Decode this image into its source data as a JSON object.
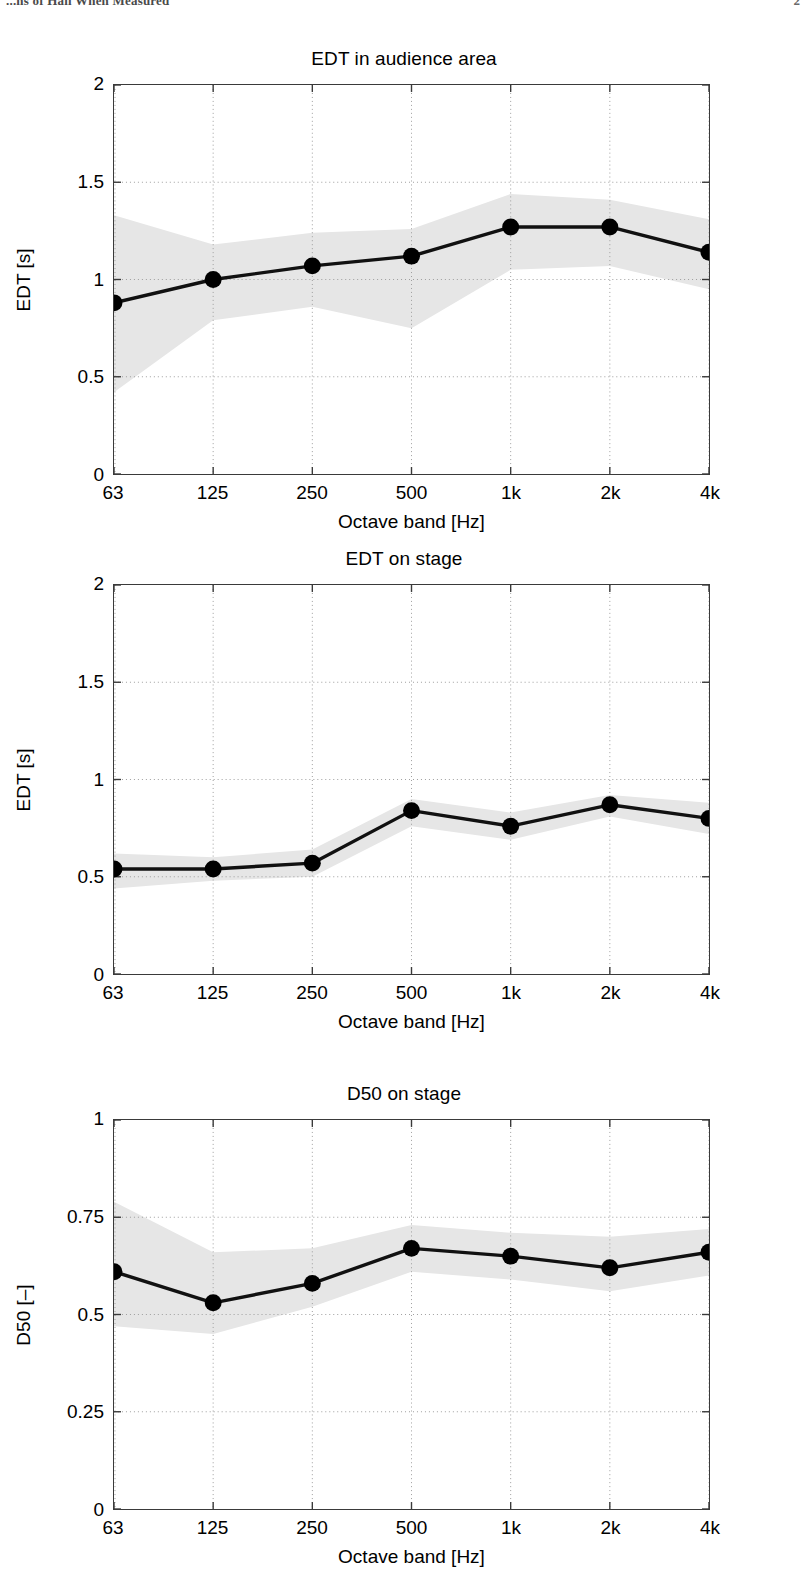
{
  "page": {
    "header_left": "...ns of Hall When Measured",
    "header_right": "2"
  },
  "figures": [
    {
      "id": "edt-audience-area",
      "chart_data": {
        "type": "line",
        "title": "EDT in audience area",
        "xlabel": "Octave band [Hz]",
        "ylabel": "EDT [s]",
        "categories": [
          "63",
          "125",
          "250",
          "500",
          "1k",
          "2k",
          "4k"
        ],
        "values": [
          0.88,
          1.0,
          1.07,
          1.12,
          1.27,
          1.27,
          1.14
        ],
        "band_upper": [
          1.33,
          1.18,
          1.24,
          1.26,
          1.44,
          1.41,
          1.31
        ],
        "band_lower": [
          0.42,
          0.79,
          0.86,
          0.75,
          1.05,
          1.07,
          0.95
        ],
        "ylim": [
          0,
          2
        ],
        "yticks": [
          0,
          0.5,
          1,
          1.5,
          2
        ],
        "ytick_labels": [
          "0",
          "0.5",
          "1",
          "1.5",
          "2"
        ],
        "grid": true,
        "legend": "none",
        "series": [
          {
            "name": "mean",
            "values": [
              0.88,
              1.0,
              1.07,
              1.12,
              1.27,
              1.27,
              1.14
            ]
          },
          {
            "name": "spread-upper",
            "values": [
              1.33,
              1.18,
              1.24,
              1.26,
              1.44,
              1.41,
              1.31
            ]
          },
          {
            "name": "spread-lower",
            "values": [
              0.42,
              0.79,
              0.86,
              0.75,
              1.05,
              1.07,
              0.95
            ]
          }
        ]
      }
    },
    {
      "id": "edt-on-stage",
      "chart_data": {
        "type": "line",
        "title": "EDT on stage",
        "xlabel": "Octave band [Hz]",
        "ylabel": "EDT [s]",
        "categories": [
          "63",
          "125",
          "250",
          "500",
          "1k",
          "2k",
          "4k"
        ],
        "values": [
          0.54,
          0.54,
          0.57,
          0.84,
          0.76,
          0.87,
          0.8
        ],
        "band_upper": [
          0.62,
          0.6,
          0.64,
          0.9,
          0.83,
          0.92,
          0.88
        ],
        "band_lower": [
          0.44,
          0.48,
          0.5,
          0.76,
          0.69,
          0.81,
          0.72
        ],
        "ylim": [
          0,
          2
        ],
        "yticks": [
          0,
          0.5,
          1,
          1.5,
          2
        ],
        "ytick_labels": [
          "0",
          "0.5",
          "1",
          "1.5",
          "2"
        ],
        "grid": true,
        "legend": "none",
        "series": [
          {
            "name": "mean",
            "values": [
              0.54,
              0.54,
              0.57,
              0.84,
              0.76,
              0.87,
              0.8
            ]
          },
          {
            "name": "spread-upper",
            "values": [
              0.62,
              0.6,
              0.64,
              0.9,
              0.83,
              0.92,
              0.88
            ]
          },
          {
            "name": "spread-lower",
            "values": [
              0.44,
              0.48,
              0.5,
              0.76,
              0.69,
              0.81,
              0.72
            ]
          }
        ]
      }
    },
    {
      "id": "d50-on-stage",
      "chart_data": {
        "type": "line",
        "title": "D50 on stage",
        "xlabel": "Octave band [Hz]",
        "ylabel": "D50 [–]",
        "categories": [
          "63",
          "125",
          "250",
          "500",
          "1k",
          "2k",
          "4k"
        ],
        "values": [
          0.61,
          0.53,
          0.58,
          0.67,
          0.65,
          0.62,
          0.66
        ],
        "band_upper": [
          0.79,
          0.66,
          0.67,
          0.73,
          0.71,
          0.7,
          0.72
        ],
        "band_lower": [
          0.47,
          0.45,
          0.52,
          0.61,
          0.59,
          0.56,
          0.6
        ],
        "ylim": [
          0,
          1
        ],
        "yticks": [
          0,
          0.25,
          0.5,
          0.75,
          1
        ],
        "ytick_labels": [
          "0",
          "0.25",
          "0.5",
          "0.75",
          "1"
        ],
        "grid": true,
        "legend": "none",
        "series": [
          {
            "name": "mean",
            "values": [
              0.61,
              0.53,
              0.58,
              0.67,
              0.65,
              0.62,
              0.66
            ]
          },
          {
            "name": "spread-upper",
            "values": [
              0.79,
              0.66,
              0.67,
              0.73,
              0.71,
              0.7,
              0.72
            ]
          },
          {
            "name": "spread-lower",
            "values": [
              0.47,
              0.45,
              0.52,
              0.61,
              0.59,
              0.56,
              0.6
            ]
          }
        ]
      }
    }
  ],
  "style": {
    "line_color": "#111111",
    "marker_color": "#000000",
    "band_color": "#e6e6e6",
    "grid_color": "#9a9a9a",
    "axis_color": "#3a3a3a"
  }
}
